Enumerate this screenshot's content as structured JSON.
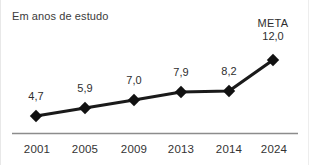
{
  "chart": {
    "title": "Em anos de estudo",
    "annotation_label": "META",
    "axis_color": "#8c8c8c",
    "line_color": "#1a1a1a",
    "marker_color": "#111111",
    "text_color": "#2e2e2e",
    "background": "#ffffff"
  },
  "chart_data": {
    "type": "line",
    "title": "Em anos de estudo",
    "xlabel": "",
    "ylabel": "",
    "categories": [
      "2001",
      "2005",
      "2009",
      "2013",
      "2014",
      "2024"
    ],
    "values": [
      4.7,
      5.9,
      7.0,
      7.9,
      8.2,
      12.0
    ],
    "value_labels": [
      "4,7",
      "5,9",
      "7,0",
      "7,9",
      "8,2",
      "12,0"
    ],
    "annotations": [
      {
        "category": "2024",
        "text": "META",
        "value_label": "12,0"
      }
    ],
    "ylim": [
      0,
      13
    ],
    "grid": false,
    "legend": false,
    "marker": "diamond"
  },
  "points": [
    {
      "year": "2001",
      "label": "4,7",
      "cx": 35,
      "cy": 116,
      "lx": 35,
      "ly": 90,
      "tx": 36,
      "ty": 143
    },
    {
      "year": "2005",
      "label": "5,9",
      "cx": 84,
      "cy": 108,
      "lx": 84,
      "ly": 82,
      "tx": 84,
      "ty": 143
    },
    {
      "year": "2009",
      "label": "7,0",
      "cx": 133,
      "cy": 100,
      "lx": 133,
      "ly": 74,
      "tx": 133,
      "ty": 143
    },
    {
      "year": "2013",
      "label": "7,9",
      "cx": 180,
      "cy": 92,
      "lx": 180,
      "ly": 66,
      "tx": 180,
      "ty": 143
    },
    {
      "year": "2014",
      "label": "8,2",
      "cx": 228,
      "cy": 91,
      "lx": 228,
      "ly": 65,
      "tx": 228,
      "ty": 143
    },
    {
      "year": "2024",
      "label": "12,0",
      "cx": 272,
      "cy": 60,
      "lx": 272,
      "ly": 17,
      "tx": 273,
      "ty": 143
    }
  ]
}
